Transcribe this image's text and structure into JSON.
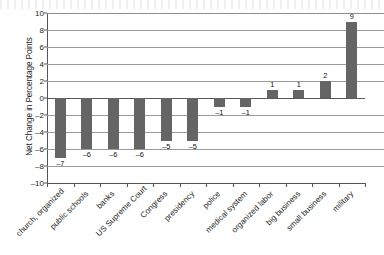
{
  "chart_data": {
    "type": "bar",
    "title": "",
    "subtitle": "",
    "xlabel": "",
    "ylabel": "Net Change in Percentage Points",
    "ylim": [
      -10,
      10
    ],
    "ytick_step": 2,
    "yticks": [
      "10",
      "8",
      "6",
      "4",
      "2",
      "0",
      "-2",
      "-4",
      "-6",
      "-8",
      "-10"
    ],
    "grid": true,
    "legend": false,
    "legend_position": "none",
    "bar_color": "#656565",
    "categories": [
      "church, organized",
      "public schools",
      "banks",
      "US Supreme Court",
      "Congress",
      "presidency",
      "police",
      "medical system",
      "organized labor",
      "big business",
      "small business",
      "military"
    ],
    "values": [
      -7,
      -6,
      -6,
      -6,
      -5,
      -5,
      -1,
      -1,
      1,
      1,
      2,
      9
    ],
    "value_labels": [
      "-7",
      "-6",
      "-6",
      "-6",
      "-5",
      "-5",
      "-1",
      "-1",
      "1",
      "1",
      "2",
      "9"
    ]
  }
}
